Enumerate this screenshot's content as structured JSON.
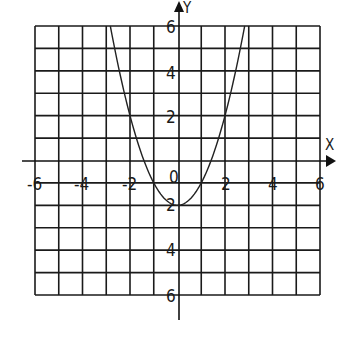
{
  "chart_data": {
    "type": "line",
    "title": "",
    "function": "y = x^2 - 2",
    "xlabel": "X",
    "ylabel": "Y",
    "xlim": [
      -6,
      6
    ],
    "ylim": [
      -6,
      6
    ],
    "grid": true,
    "grid_step": 1,
    "legend": null,
    "x_tick_labels": [
      "-6",
      "-4",
      "-2",
      "2",
      "4",
      "6"
    ],
    "x_ticks": [
      -6,
      -4,
      -2,
      2,
      4,
      6
    ],
    "y_tick_labels": [
      "6",
      "4",
      "2",
      "-2",
      "-4",
      "-6"
    ],
    "y_ticks": [
      6,
      4,
      2,
      -2,
      -4,
      -6
    ],
    "origin_label": "0",
    "series": [
      {
        "name": "parabola",
        "x": [
          -2.83,
          -2.5,
          -2,
          -1.5,
          -1.41,
          -1,
          -0.5,
          0,
          0.5,
          1,
          1.41,
          1.5,
          2,
          2.5,
          2.83
        ],
        "y": [
          6,
          4.25,
          2,
          0.25,
          0,
          -1,
          -1.75,
          -2,
          -1.75,
          -1,
          0,
          0.25,
          2,
          4.25,
          6
        ]
      }
    ],
    "vertex": [
      0,
      -2
    ],
    "x_intercepts": [
      -1.41,
      1.41
    ],
    "y_intercept": -2
  },
  "labels": {
    "x_axis": "X",
    "y_axis": "Y",
    "origin": "0",
    "x_ticks": {
      "n6": "-6",
      "n4": "-4",
      "n2": "-2",
      "p2": "2",
      "p4": "4",
      "p6": "6"
    },
    "y_ticks": {
      "p6": "6",
      "p4": "4",
      "p2": "2",
      "n2": "2",
      "n4": "4",
      "n6": "6"
    }
  }
}
